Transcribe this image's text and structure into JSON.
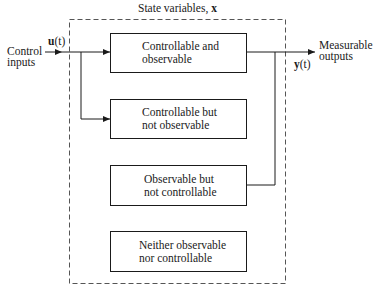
{
  "diagram": {
    "title": "State variables, ",
    "title_symbol": "x",
    "input": {
      "label_line1": "Control",
      "label_line2": "inputs",
      "signal_bold": "u",
      "signal_arg": "(t)"
    },
    "output": {
      "label_line1": "Measurable",
      "label_line2": "outputs",
      "signal_bold": "y",
      "signal_arg": "(t)"
    },
    "blocks": [
      {
        "line1": "Controllable and",
        "line2": "observable"
      },
      {
        "line1": "Controllable but",
        "line2": "not observable"
      },
      {
        "line1": "Observable but",
        "line2": "not controllable"
      },
      {
        "line1": "Neither observable",
        "line2": "nor controllable"
      }
    ],
    "colors": {
      "ink": "#1a1a1a",
      "dashed_border": "#555555",
      "background": "#ffffff"
    }
  }
}
